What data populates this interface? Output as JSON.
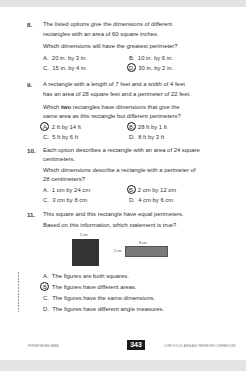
{
  "questions": [
    {
      "number": "8.",
      "stem": [
        "The listed options give the dimensions of different",
        "rectangles with an area of 60 square inches."
      ],
      "prompt": "Which dimensions will have the greatest perimeter?",
      "choices": [
        {
          "letter": "A.",
          "text": "20 in. by 3 in.",
          "selected": false
        },
        {
          "letter": "B.",
          "text": "10 in. by 6 in.",
          "selected": false
        },
        {
          "letter": "C.",
          "text": "15 in. by 4 in.",
          "selected": false
        },
        {
          "letter": "D.",
          "text": "30 in. by 2 in.",
          "selected": true
        }
      ]
    },
    {
      "number": "9.",
      "stem": [
        "A rectangle with a length of 7 feet and a width of 4 feet",
        "has an area of 28 square feet and a perimeter of 22 feet."
      ],
      "prompt_pre": "Which ",
      "prompt_bold": "two",
      "prompt_post": " rectangles have dimensions that give the",
      "prompt_line2": "same area as this rectangle but different perimeters?",
      "choices": [
        {
          "letter": "A.",
          "text": "2 ft by 14 ft",
          "selected": true
        },
        {
          "letter": "B.",
          "text": "28 ft by 1 ft",
          "selected": true
        },
        {
          "letter": "C.",
          "text": "5 ft by 6 ft",
          "selected": false
        },
        {
          "letter": "D.",
          "text": "8 ft by 3 ft",
          "selected": false
        }
      ]
    },
    {
      "number": "10.",
      "stem": [
        "Each option describes a rectangle with an area of 24 square",
        "centimeters."
      ],
      "prompt": [
        "Which dimensions describe a rectangle with a perimeter of",
        "28 centimeters?"
      ],
      "choices": [
        {
          "letter": "A.",
          "text": "1 cm by 24 cm",
          "selected": false
        },
        {
          "letter": "B.",
          "text": "2 cm by 12 cm",
          "selected": true
        },
        {
          "letter": "C.",
          "text": "3 cm by 8 cm",
          "selected": false
        },
        {
          "letter": "D.",
          "text": "4 cm by 6 cm",
          "selected": false
        }
      ]
    },
    {
      "number": "11.",
      "stem": "This square and this rectangle have equal perimeters.",
      "prompt": "Based on this information, which statement is true?",
      "figure": {
        "square_label": "5 cm",
        "rect_top_label": "8 cm",
        "rect_side_label": "2 cm",
        "square_color": "#333333",
        "rect_color": "#7a7a7a"
      },
      "choices": [
        {
          "letter": "A.",
          "text": "The figures are both squares.",
          "selected": false
        },
        {
          "letter": "B.",
          "text": "The figures have different areas.",
          "selected": true
        },
        {
          "letter": "C.",
          "text": "The figures have the same dimensions.",
          "selected": false
        },
        {
          "letter": "D.",
          "text": "The figures have different angle measures.",
          "selected": false
        }
      ]
    }
  ],
  "footer": {
    "left": "PERIMETER AND AREA",
    "page_number": "343",
    "right": "CORE FOCUS: AREA AND PERIMETER COMPARISONS"
  }
}
